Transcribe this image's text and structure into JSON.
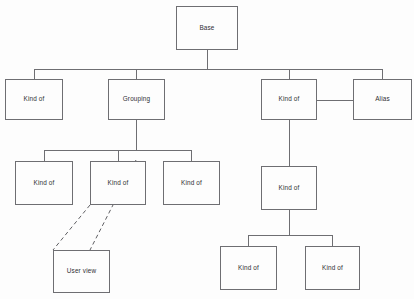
{
  "diagram": {
    "background_color": "#fdfdfd",
    "line_color": "#6e6e72",
    "dashed_line_color": "#5f5f63",
    "text_color": "#2f2f33",
    "nodes": [
      {
        "id": "base",
        "label": "Base",
        "x": 176,
        "y": 6,
        "w": 62,
        "h": 44
      },
      {
        "id": "kind1",
        "label": "Kind of",
        "x": 5,
        "y": 79,
        "w": 58,
        "h": 41
      },
      {
        "id": "grouping",
        "label": "Grouping",
        "x": 108,
        "y": 79,
        "w": 57,
        "h": 41
      },
      {
        "id": "kind2",
        "label": "Kind of",
        "x": 261,
        "y": 79,
        "w": 56,
        "h": 41
      },
      {
        "id": "alias",
        "label": "Alias",
        "x": 353,
        "y": 79,
        "w": 59,
        "h": 41
      },
      {
        "id": "kind3",
        "label": "Kind of",
        "x": 15,
        "y": 161,
        "w": 58,
        "h": 44
      },
      {
        "id": "kind4",
        "label": "Kind of",
        "x": 90,
        "y": 161,
        "w": 56,
        "h": 44
      },
      {
        "id": "kind5",
        "label": "Kind of",
        "x": 163,
        "y": 161,
        "w": 57,
        "h": 44
      },
      {
        "id": "kind6",
        "label": "Kind of",
        "x": 261,
        "y": 166,
        "w": 56,
        "h": 44
      },
      {
        "id": "userview",
        "label": "User view",
        "x": 53,
        "y": 250,
        "w": 57,
        "h": 43
      },
      {
        "id": "kind7",
        "label": "Kind of",
        "x": 220,
        "y": 246,
        "w": 57,
        "h": 44
      },
      {
        "id": "kind8",
        "label": "Kind of",
        "x": 305,
        "y": 246,
        "w": 55,
        "h": 44
      }
    ],
    "edges": [
      {
        "id": "base-to-bus",
        "from": "base",
        "to": "row2-bus",
        "style": "solid"
      },
      {
        "id": "bus-to-kind1",
        "from": "row2-bus",
        "to": "kind1",
        "style": "solid"
      },
      {
        "id": "bus-to-grouping",
        "from": "row2-bus",
        "to": "grouping",
        "style": "solid"
      },
      {
        "id": "bus-to-kind2",
        "from": "row2-bus",
        "to": "kind2",
        "style": "solid"
      },
      {
        "id": "bus-to-alias",
        "from": "row2-bus",
        "to": "alias",
        "style": "solid"
      },
      {
        "id": "kind2-to-alias",
        "from": "kind2",
        "to": "alias",
        "style": "solid"
      },
      {
        "id": "grouping-to-kind3",
        "from": "grouping",
        "to": "kind3",
        "style": "solid"
      },
      {
        "id": "grouping-to-kind4",
        "from": "grouping",
        "to": "kind4",
        "style": "solid"
      },
      {
        "id": "grouping-to-kind5",
        "from": "grouping",
        "to": "kind5",
        "style": "solid"
      },
      {
        "id": "kind2-to-kind6",
        "from": "kind2",
        "to": "kind6",
        "style": "solid"
      },
      {
        "id": "kind6-to-kind7",
        "from": "kind6",
        "to": "kind7",
        "style": "solid"
      },
      {
        "id": "kind6-to-kind8",
        "from": "kind6",
        "to": "kind8",
        "style": "solid"
      },
      {
        "id": "kind4-to-userview-left",
        "from": "kind4",
        "to": "userview",
        "style": "dashed"
      },
      {
        "id": "kind4-to-userview-right",
        "from": "kind4",
        "to": "userview",
        "style": "dashed"
      }
    ]
  }
}
